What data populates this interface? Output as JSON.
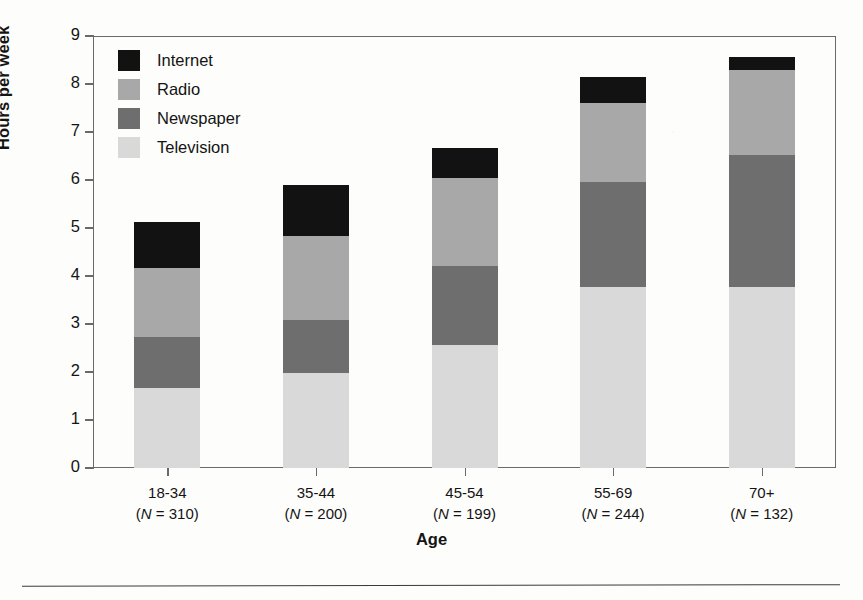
{
  "chart_data": {
    "type": "bar",
    "subtype": "stacked-vertical",
    "title": "",
    "xlabel": "Age",
    "ylabel": "Hours per week",
    "ylim": [
      0,
      9
    ],
    "ytick_step": 1,
    "yticks": [
      "9",
      "8",
      "7",
      "6",
      "5",
      "4",
      "3",
      "2",
      "1",
      "0"
    ],
    "grid": false,
    "legend_position": "inside-top-left",
    "categories": [
      "18-34",
      "35-44",
      "45-54",
      "55-69",
      "70+"
    ],
    "category_n_labels": [
      "(N = 310)",
      "(N = 200)",
      "(N = 199)",
      "(N = 244)",
      "(N = 132)"
    ],
    "category_n_values": [
      310,
      200,
      199,
      244,
      132
    ],
    "stack_order_bottom_to_top": [
      "Television",
      "Newspaper",
      "Radio",
      "Internet"
    ],
    "legend_order_top_to_bottom": [
      "Internet",
      "Radio",
      "Newspaper",
      "Television"
    ],
    "series": [
      {
        "name": "Television",
        "color": "#d9d9d9",
        "values": [
          1.67,
          1.98,
          2.56,
          3.77,
          3.77
        ]
      },
      {
        "name": "Newspaper",
        "color": "#6e6e6e",
        "values": [
          1.06,
          1.1,
          1.65,
          2.19,
          2.75
        ]
      },
      {
        "name": "Radio",
        "color": "#a8a8a8",
        "values": [
          1.44,
          1.75,
          1.83,
          1.64,
          1.77
        ]
      },
      {
        "name": "Internet",
        "color": "#121212",
        "values": [
          0.96,
          1.07,
          0.63,
          0.55,
          0.27
        ]
      }
    ],
    "totals": [
      5.13,
      5.9,
      6.67,
      8.15,
      8.56
    ]
  },
  "legend": {
    "items": [
      {
        "label": "Internet",
        "color": "#121212"
      },
      {
        "label": "Radio",
        "color": "#a8a8a8"
      },
      {
        "label": "Newspaper",
        "color": "#6e6e6e"
      },
      {
        "label": "Television",
        "color": "#d9d9d9"
      }
    ]
  },
  "axes": {
    "y_title": "Hours per week",
    "x_title": "Age"
  },
  "colors": {
    "frame": "#6a6a6a",
    "text": "#141414",
    "rule": "#3a3a3a",
    "background": "#fdfdfb"
  }
}
